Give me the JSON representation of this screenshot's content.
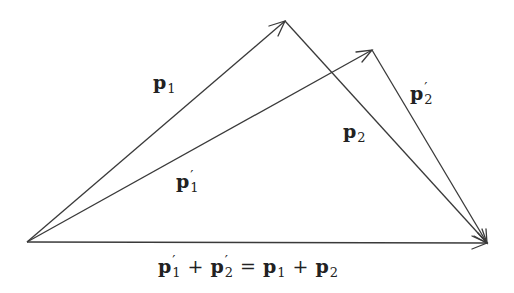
{
  "diagram": {
    "stroke_color": "#3a3a3a",
    "points": {
      "origin": [
        27,
        242
      ],
      "p1_tip": [
        285,
        21
      ],
      "p1prime_tip": [
        372,
        50
      ],
      "sum_tip": [
        487,
        243
      ]
    },
    "vectors": [
      {
        "id": "p1",
        "from": "origin",
        "to": "p1_tip"
      },
      {
        "id": "p2",
        "from": "p1_tip",
        "to": "sum_tip"
      },
      {
        "id": "p1prime",
        "from": "origin",
        "to": "p1prime_tip"
      },
      {
        "id": "p2prime",
        "from": "p1prime_tip",
        "to": "sum_tip"
      },
      {
        "id": "sum",
        "from": "origin",
        "to": "sum_tip"
      }
    ],
    "labels": {
      "p1": {
        "base": "p",
        "sub": "1",
        "prime": ""
      },
      "p2": {
        "base": "p",
        "sub": "2",
        "prime": ""
      },
      "p1prime": {
        "base": "p",
        "sub": "1",
        "prime": "′"
      },
      "p2prime": {
        "base": "p",
        "sub": "2",
        "prime": "′"
      }
    },
    "equation": {
      "terms": [
        {
          "base": "p",
          "sub": "1",
          "prime": "′"
        },
        {
          "op": "+"
        },
        {
          "base": "p",
          "sub": "2",
          "prime": "′"
        },
        {
          "op": "="
        },
        {
          "base": "p",
          "sub": "1",
          "prime": ""
        },
        {
          "op": "+"
        },
        {
          "base": "p",
          "sub": "2",
          "prime": ""
        }
      ],
      "t0_base": "p",
      "t0_sub": "1",
      "t0_prime": "′",
      "op1": "+",
      "t1_base": "p",
      "t1_sub": "2",
      "t1_prime": "′",
      "op2": "=",
      "t2_base": "p",
      "t2_sub": "1",
      "op3": "+",
      "t3_base": "p",
      "t3_sub": "2"
    }
  }
}
